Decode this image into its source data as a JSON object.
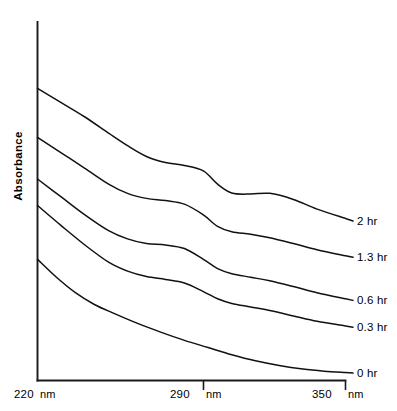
{
  "chart_data": {
    "type": "line",
    "title": "",
    "xlabel": "",
    "ylabel": "Absorbance",
    "xunit": "nm",
    "xlim": [
      220,
      350
    ],
    "ylim": [
      0,
      1
    ],
    "grid": false,
    "legend_position": "right-inline-labels",
    "x_ticks": [
      {
        "value": 220,
        "label": "220",
        "unit": "nm"
      },
      {
        "value": 290,
        "label": "290",
        "unit": "nm"
      },
      {
        "value": 350,
        "label": "350",
        "unit": "nm"
      }
    ],
    "y_ticks": [],
    "series": [
      {
        "name": "2 hr",
        "label": "2 hr",
        "x": [
          220,
          230,
          240,
          250,
          258,
          266,
          274,
          282,
          290,
          296,
          302,
          310,
          318,
          328,
          338,
          350
        ],
        "values": [
          0.815,
          0.775,
          0.735,
          0.69,
          0.655,
          0.625,
          0.608,
          0.6,
          0.585,
          0.548,
          0.523,
          0.52,
          0.522,
          0.505,
          0.478,
          0.452
        ]
      },
      {
        "name": "1.3 hr",
        "label": "1.3 hr",
        "x": [
          220,
          230,
          240,
          250,
          258,
          266,
          274,
          282,
          290,
          296,
          302,
          310,
          318,
          328,
          338,
          350
        ],
        "values": [
          0.678,
          0.635,
          0.592,
          0.548,
          0.522,
          0.508,
          0.502,
          0.492,
          0.462,
          0.43,
          0.415,
          0.408,
          0.398,
          0.382,
          0.365,
          0.348
        ]
      },
      {
        "name": "0.6 hr",
        "label": "0.6 hr",
        "x": [
          220,
          230,
          240,
          250,
          258,
          266,
          274,
          282,
          290,
          296,
          302,
          310,
          318,
          328,
          338,
          350
        ],
        "values": [
          0.562,
          0.512,
          0.462,
          0.418,
          0.395,
          0.382,
          0.378,
          0.368,
          0.338,
          0.312,
          0.298,
          0.288,
          0.278,
          0.262,
          0.245,
          0.228
        ]
      },
      {
        "name": "0.3 hr",
        "label": "0.3 hr",
        "x": [
          220,
          230,
          240,
          250,
          258,
          266,
          274,
          282,
          290,
          296,
          302,
          310,
          318,
          328,
          338,
          350
        ],
        "values": [
          0.488,
          0.432,
          0.378,
          0.33,
          0.305,
          0.29,
          0.282,
          0.272,
          0.248,
          0.228,
          0.215,
          0.205,
          0.195,
          0.18,
          0.165,
          0.152
        ]
      },
      {
        "name": "0 hr",
        "label": "0 hr",
        "x": [
          220,
          228,
          236,
          244,
          252,
          262,
          272,
          282,
          292,
          302,
          312,
          322,
          332,
          341,
          350
        ],
        "values": [
          0.338,
          0.288,
          0.245,
          0.212,
          0.188,
          0.16,
          0.135,
          0.112,
          0.092,
          0.072,
          0.055,
          0.042,
          0.032,
          0.026,
          0.022
        ]
      }
    ]
  },
  "axis": {
    "y_title": "Absorbance"
  },
  "colors": {
    "line": "#111111",
    "axis": "#1a1a1a",
    "background": "#ffffff"
  }
}
